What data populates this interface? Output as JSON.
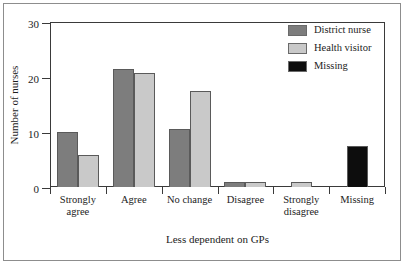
{
  "chart_data": {
    "type": "bar",
    "title": "",
    "xlabel": "Less dependent on GPs",
    "ylabel": "Number of nurses",
    "categories": [
      "Strongly agree",
      "Agree",
      "No change",
      "Disagree",
      "Strongly disagree",
      "Missing"
    ],
    "category_lines": [
      [
        "Strongly",
        "agree"
      ],
      [
        "Agree",
        ""
      ],
      [
        "No change",
        ""
      ],
      [
        "Disagree",
        ""
      ],
      [
        "Strongly",
        "disagree"
      ],
      [
        "Missing",
        ""
      ]
    ],
    "series": [
      {
        "name": "District nurse",
        "color": "#7d7d7d",
        "values": [
          10,
          21.5,
          10.5,
          1,
          0,
          0
        ]
      },
      {
        "name": "Health visitor",
        "color": "#c9c9c9",
        "values": [
          5.8,
          20.7,
          17.5,
          1,
          1,
          0
        ]
      },
      {
        "name": "Missing",
        "color": "#0d0d0d",
        "values": [
          0,
          0,
          0,
          0,
          0,
          7.4
        ]
      }
    ],
    "ylim": [
      0,
      30
    ],
    "yticks": [
      0,
      10,
      20,
      30
    ],
    "ytick_labels": [
      "0",
      "10",
      "20",
      "30"
    ],
    "grid": false,
    "legend_position": "top-right"
  },
  "legend": {
    "entries": [
      {
        "label": "District nurse",
        "color": "#7d7d7d"
      },
      {
        "label": "Health visitor",
        "color": "#c9c9c9"
      },
      {
        "label": "Missing",
        "color": "#0d0d0d"
      }
    ]
  },
  "axes": {
    "y_title": "Number of nurses",
    "x_title": "Less dependent on GPs",
    "y_labels": [
      "30",
      "20",
      "10",
      "0"
    ]
  }
}
